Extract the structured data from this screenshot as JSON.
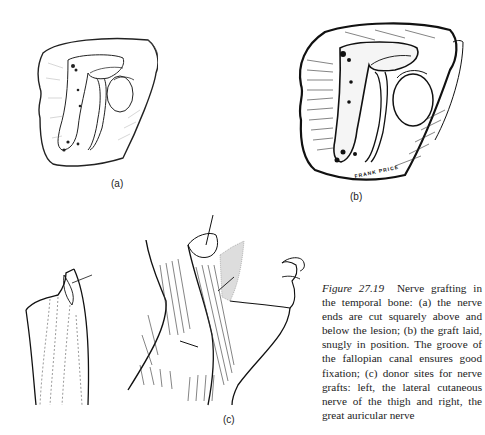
{
  "figure": {
    "number_label": "Figure 27.19",
    "caption_text": "Nerve grafting in the temporal bone: (a) the nerve ends are cut squarely above and below the lesion; (b) the graft laid, snugly in position. The groove of the fallopian canal ensures good fixation; (c) donor sites for nerve grafts: left, the lateral cutaneous nerve of the thigh and right, the great auricular nerve"
  },
  "panels": {
    "a": {
      "label": "(a)",
      "description": "temporal bone drawing with nerve ends cut"
    },
    "b": {
      "label": "(b)",
      "description": "temporal bone drawing with graft in position",
      "artist_signature": "FRANK PRICE"
    },
    "c": {
      "label": "(c)",
      "description": "donor sites: thigh (left) and neck/great auricular nerve (right)"
    }
  }
}
